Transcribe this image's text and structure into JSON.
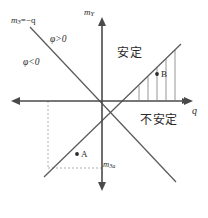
{
  "figure": {
    "background_color": "#ffffff",
    "line_color": "#555555",
    "axis_color": "#4a4a4a",
    "dashed_color": "#aaaaaa",
    "text_color": "#2b2b2b",
    "width": 208,
    "height": 218
  },
  "axes": {
    "origin": {
      "x": 102,
      "y": 101
    },
    "horizontal": {
      "name": "q-axis",
      "label": "q",
      "label_style": "italic",
      "x_start": 12,
      "x_end": 192,
      "y": 101,
      "arrows": "both"
    },
    "vertical": {
      "name": "m_Y-axis",
      "label_main": "m",
      "label_sub": "Y",
      "y_start": 18,
      "y_end": 190,
      "x": 102,
      "arrows": "both"
    }
  },
  "lines": [
    {
      "name": "descending-boundary-line",
      "label_main": "m",
      "label_sub": "3",
      "label_tail": "=−q",
      "slope": "negative",
      "x1": 30,
      "y1": 27,
      "x2": 176,
      "y2": 182
    },
    {
      "name": "ascending-boundary-line",
      "label": "",
      "slope": "positive",
      "x1": 44,
      "y1": 177,
      "x2": 181,
      "y2": 44
    }
  ],
  "hatched_region": {
    "name": "hatched-wedge",
    "description": "hatched wedge between the ascending line and the q-axis in the first quadrant",
    "stroke_color": "#8a8a8a",
    "hatch_count": 5
  },
  "dashed_guides": [
    {
      "name": "vertical-dashed-guide",
      "x": 48,
      "y1": 101,
      "y2": 168
    },
    {
      "name": "horizontal-dashed-guide",
      "y": 168,
      "x1": 48,
      "x2": 102
    }
  ],
  "regions": [
    {
      "name": "stable-region-label",
      "text": "安定",
      "meaning": "stable"
    },
    {
      "name": "unstable-region-label",
      "text": "不安定",
      "meaning": "unstable"
    }
  ],
  "annotations": {
    "phi_positive": {
      "symbol": "φ",
      "relation": ">",
      "value": "0",
      "text": "φ>0"
    },
    "phi_negative": {
      "symbol": "φ",
      "relation": "<",
      "value": "0",
      "text": "φ<0"
    },
    "axis_tick_label": {
      "main": "m",
      "sub": "3a"
    }
  },
  "points": [
    {
      "name": "point-A",
      "label": "A",
      "x": 77,
      "y": 154,
      "quadrant": "third"
    },
    {
      "name": "point-B",
      "label": "B",
      "x": 157,
      "y": 74,
      "quadrant": "first"
    }
  ]
}
